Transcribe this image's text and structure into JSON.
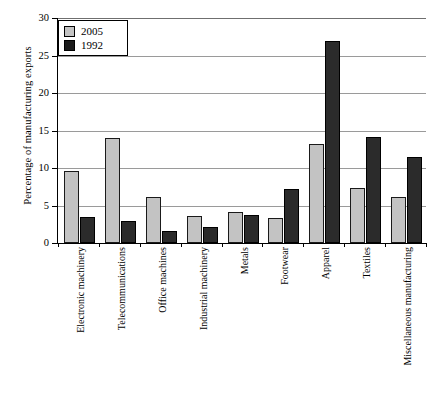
{
  "chart_data": {
    "type": "bar",
    "title": "",
    "xlabel": "",
    "ylabel": "Percentage of manufacturing exports",
    "ylim": [
      0,
      30
    ],
    "yticks": [
      0,
      5,
      10,
      15,
      20,
      25,
      30
    ],
    "grid": true,
    "legend_position": "top-left",
    "categories": [
      "Electronic machinery",
      "Telecommunications",
      "Office machines",
      "Industrial machinery",
      "Metals",
      "Footwear",
      "Apparel",
      "Textiles",
      "Miscellaneous manufacturing"
    ],
    "series": [
      {
        "name": "2005",
        "color": "#c3c3c3",
        "values": [
          9.6,
          14.0,
          6.1,
          3.6,
          4.2,
          3.3,
          13.2,
          7.3,
          6.2
        ]
      },
      {
        "name": "1992",
        "color": "#2b2b2b",
        "values": [
          3.5,
          3.0,
          1.6,
          2.2,
          3.8,
          7.2,
          27.0,
          14.2,
          11.5
        ]
      }
    ]
  },
  "legend": {
    "items": [
      {
        "label": "2005",
        "swatch": "light-gray-square"
      },
      {
        "label": "1992",
        "swatch": "black-square"
      }
    ]
  },
  "axis": {
    "y_title": "Percentage of manufacturing exports",
    "y_tick_labels": [
      "0",
      "5",
      "10",
      "15",
      "20",
      "25",
      "30"
    ]
  }
}
